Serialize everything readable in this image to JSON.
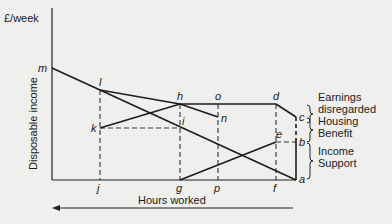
{
  "diagram": {
    "y_axis_unit": "£/week",
    "y_axis_label": "Disposable income",
    "x_axis_label": "Hours worked",
    "x_axis_direction": "decreasing to the right (arrow points left = more hours)",
    "points": {
      "m": "m",
      "l": "l",
      "h": "h",
      "o": "o",
      "d": "d",
      "c": "c",
      "n": "n",
      "k": "k",
      "i": "i",
      "e": "e",
      "b": "b",
      "a": "a",
      "j": "j",
      "g": "g",
      "p": "p",
      "f": "f"
    },
    "solid_lines": [
      [
        "m",
        "l"
      ],
      [
        "l",
        "h"
      ],
      [
        "h",
        "d"
      ],
      [
        "d",
        "c"
      ],
      [
        "h",
        "n"
      ],
      [
        "l",
        "a"
      ],
      [
        "k",
        "h"
      ],
      [
        "g",
        "e"
      ],
      [
        "c",
        "b"
      ],
      [
        "b",
        "a"
      ]
    ],
    "dashed_lines": [
      [
        "l",
        "j"
      ],
      [
        "k",
        "i"
      ],
      [
        "h",
        "g"
      ],
      [
        "o",
        "p"
      ],
      [
        "d",
        "f"
      ],
      [
        "e",
        "b"
      ]
    ],
    "brace_labels": {
      "earnings_disregarded_1": "Earnings",
      "earnings_disregarded_2": "disregarded",
      "housing_benefit_1": "Housing",
      "housing_benefit_2": "Benefit",
      "income_support_1": "Income",
      "income_support_2": "Support"
    }
  }
}
